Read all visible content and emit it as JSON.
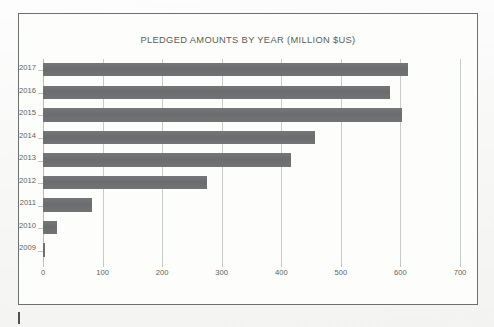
{
  "figure": {
    "title": "PLEDGED AMOUNTS BY YEAR (MILLION $US)",
    "frame_color": "#6d6f70",
    "background_color": "#fdfdfc"
  },
  "chart_data": {
    "type": "bar",
    "orientation": "horizontal",
    "title": "PLEDGED AMOUNTS BY YEAR (MILLION $US)",
    "xlabel": "",
    "ylabel": "",
    "categories": [
      "2017",
      "2016",
      "2015",
      "2014",
      "2013",
      "2012",
      "2011",
      "2010",
      "2009"
    ],
    "values": [
      613,
      583,
      603,
      457,
      416,
      276,
      82,
      23,
      4
    ],
    "series": [
      {
        "name": "Pledged amounts (million $US)",
        "values": [
          613,
          583,
          603,
          457,
          416,
          276,
          82,
          23,
          4
        ],
        "color": "#6e7071"
      }
    ],
    "xlim": [
      0,
      700
    ],
    "xticks": [
      0,
      100,
      200,
      300,
      400,
      500,
      600,
      700
    ],
    "xticklabels": [
      "0",
      "100",
      "200",
      "300",
      "400",
      "500",
      "600",
      "700"
    ],
    "grid": true,
    "grid_axis": "x",
    "grid_color": "#c9cacb",
    "legend": false,
    "legend_position": "none",
    "bar_color": "#6e7071",
    "tick_label_color": "#5d5f60",
    "title_color": "#5a5c5d"
  },
  "caret": {
    "name": "text-cursor-mark",
    "color": "#4f5152"
  }
}
